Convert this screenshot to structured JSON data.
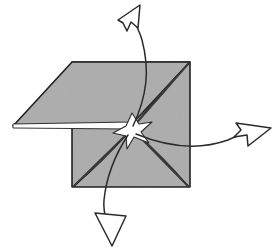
{
  "figure": {
    "type": "line-drawing",
    "background_color": "#ffffff",
    "ink_color": "#2b2b2b",
    "paper_fill_color": "#b0b0b0",
    "paper_edge_color": "#1f1f1f",
    "highlight_color": "#ffffff",
    "canvas": {
      "width": 274,
      "height": 251
    }
  },
  "shapes": {
    "square_sheet": {
      "label": "square-sheet",
      "fill": "#b0b0b0",
      "points": "72,62 190,62 190,187 72,187"
    },
    "folded_flap": {
      "label": "folded-flap",
      "fill": "#b0b0b0",
      "points": "72,62 190,62 130,126 13,126"
    },
    "flap_highlight_strip": {
      "label": "flap-highlight-strip",
      "fill": "#ffffff",
      "points": "13,124 132,122 132,129 13,128"
    },
    "center_star": {
      "label": "center-star",
      "fill": "#ffffff",
      "center_x": 132,
      "center_y": 129,
      "points": "132,113 139,124 152,122 141,132 149,143 134,137 127,149 126,136 113,133 126,126"
    },
    "creases": [
      {
        "name": "crease-top-right",
        "from_x": 189,
        "from_y": 63,
        "to_x": 134,
        "to_y": 126
      },
      {
        "name": "crease-bottom-left",
        "from_x": 74,
        "from_y": 186,
        "to_x": 128,
        "to_y": 133
      },
      {
        "name": "crease-bottom-right",
        "from_x": 188,
        "from_y": 186,
        "to_x": 136,
        "to_y": 133
      }
    ]
  },
  "arrows": [
    {
      "name": "arrow-up",
      "direction": "up",
      "description": "curved arrow from center sweeping up and pointing up-left",
      "path": "M 133,126 C 147,96 150,70 142,40 C 138,26 133,20 129,14",
      "head_points": "118,20 140,5 138,28 131,22 127,31 123,23"
    },
    {
      "name": "arrow-right",
      "direction": "right",
      "description": "curved arrow from center sweeping right and pointing right-up",
      "path": "M 136,134 C 170,148 200,150 228,140 C 238,136 243,133 248,130",
      "head_points": "236,123 271,128 248,146 247,135 234,137 241,130"
    },
    {
      "name": "arrow-down",
      "direction": "down",
      "description": "curved arrow from center sweeping down and pointing down",
      "path": "M 128,135 C 113,158 106,180 104,200 C 103,210 105,216 107,222",
      "head_points": "95,213 126,216 112,246"
    }
  ],
  "annotations": {
    "arrow_count": "3",
    "fold_count": "3"
  }
}
